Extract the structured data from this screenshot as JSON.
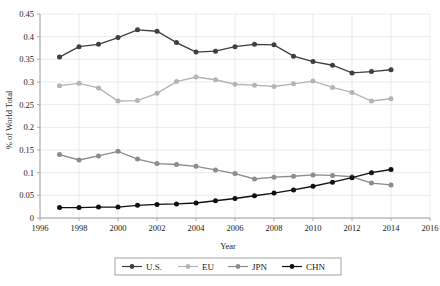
{
  "chart_data": {
    "type": "line",
    "title": "",
    "subtitle": "",
    "xlabel": "Year",
    "ylabel": "% of World Total",
    "xlim": [
      1996,
      2016
    ],
    "ylim": [
      0,
      0.45
    ],
    "xticks": [
      1996,
      1998,
      2000,
      2002,
      2004,
      2006,
      2008,
      2010,
      2012,
      2014,
      2016
    ],
    "xtick_labels": [
      "1996",
      "1998",
      "2000",
      "2002",
      "2004",
      "2006",
      "2008",
      "2010",
      "2012",
      "2014",
      "2016"
    ],
    "yticks": [
      0,
      0.05,
      0.1,
      0.15,
      0.2,
      0.25,
      0.3,
      0.35,
      0.4,
      0.45
    ],
    "ytick_labels": [
      "0",
      "0.05",
      "0.1",
      "0.15",
      "0.2",
      "0.25",
      "0.3",
      "0.35",
      "0.4",
      "0.45"
    ],
    "grid": true,
    "grid_axes": "both",
    "legend_position": "bottom-center",
    "x": [
      1997,
      1998,
      1999,
      2000,
      2001,
      2002,
      2003,
      2004,
      2005,
      2006,
      2007,
      2008,
      2009,
      2010,
      2011,
      2012,
      2013,
      2014
    ],
    "series": [
      {
        "name": "U.S.",
        "color": "#3f3f3f",
        "marker": "circle",
        "values": [
          0.355,
          0.378,
          0.383,
          0.398,
          0.415,
          0.412,
          0.387,
          0.366,
          0.368,
          0.378,
          0.383,
          0.382,
          0.357,
          0.345,
          0.337,
          0.32,
          0.323,
          0.327
        ]
      },
      {
        "name": "EU",
        "color": "#b4b4b4",
        "marker": "circle",
        "values": [
          0.292,
          0.297,
          0.287,
          0.258,
          0.259,
          0.275,
          0.301,
          0.311,
          0.305,
          0.295,
          0.293,
          0.29,
          0.296,
          0.302,
          0.288,
          0.277,
          0.258,
          0.263
        ]
      },
      {
        "name": "JPN",
        "color": "#8c8c8c",
        "marker": "circle",
        "values": [
          0.14,
          0.128,
          0.137,
          0.147,
          0.13,
          0.12,
          0.118,
          0.114,
          0.106,
          0.098,
          0.086,
          0.09,
          0.092,
          0.095,
          0.094,
          0.091,
          0.077,
          0.073
        ]
      },
      {
        "name": "CHN",
        "color": "#101010",
        "marker": "circle",
        "values": [
          0.023,
          0.023,
          0.024,
          0.024,
          0.028,
          0.03,
          0.031,
          0.033,
          0.038,
          0.043,
          0.049,
          0.055,
          0.062,
          0.07,
          0.079,
          0.089,
          0.1,
          0.107
        ]
      }
    ]
  },
  "legend": {
    "items": [
      {
        "label": "U.S."
      },
      {
        "label": "EU"
      },
      {
        "label": "JPN"
      },
      {
        "label": "CHN"
      }
    ]
  }
}
